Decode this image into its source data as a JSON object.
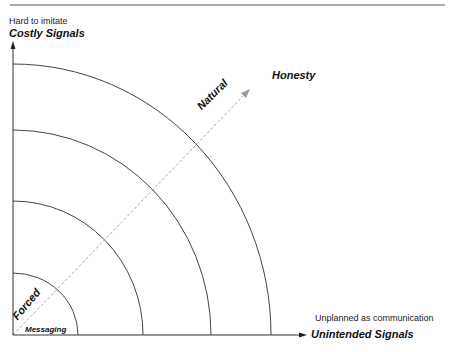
{
  "diagram": {
    "y_axis": {
      "subtitle": "Hard to imitate",
      "title": "Costly Signals"
    },
    "x_axis": {
      "subtitle": "Unplanned as communication",
      "title": "Unintended Signals"
    },
    "diagonal": {
      "start_label": "Forced",
      "mid_label": "Natural",
      "end_label": "Honesty"
    },
    "origin_label": "Messaging",
    "arcs": [
      {
        "rx": 65,
        "ry": 62
      },
      {
        "rx": 130,
        "ry": 134
      },
      {
        "rx": 198,
        "ry": 205
      },
      {
        "rx": 258,
        "ry": 271
      }
    ],
    "colors": {
      "axis": "#333333",
      "arc": "#444444",
      "dashed": "#aaaaaa",
      "rule": "#555555"
    }
  }
}
